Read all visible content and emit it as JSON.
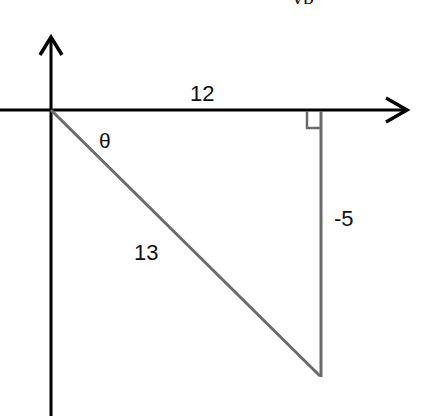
{
  "diagram": {
    "type": "right-triangle-on-axes",
    "top_fragment": "yp",
    "labels": {
      "adjacent": "12",
      "opposite": "-5",
      "hypotenuse": "13",
      "angle": "θ"
    },
    "colors": {
      "axes": "#000000",
      "triangle": "#6b6b6b",
      "text": "#111111"
    },
    "geometry": {
      "origin": [
        51,
        110
      ],
      "right_angle_vertex": [
        321,
        110
      ],
      "bottom_vertex": [
        321,
        376
      ]
    }
  }
}
